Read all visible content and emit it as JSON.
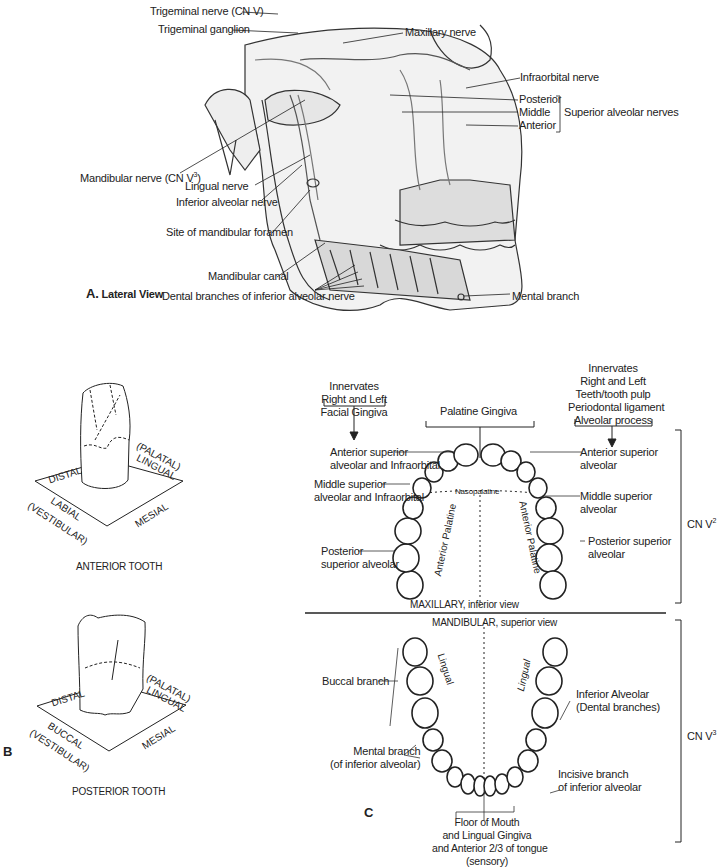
{
  "panel_a": {
    "title_letter": "A.",
    "title": "Lateral View",
    "labels": {
      "trigeminal_nerve": "Trigeminal nerve (CN V)",
      "trigeminal_ganglion": "Trigeminal ganglion",
      "maxillary_nerve": "Maxillary nerve",
      "infraorbital_nerve": "Infraorbital nerve",
      "posterior": "Posterior",
      "middle": "Middle",
      "anterior": "Anterior",
      "superior_alveolar_nerves": "Superior alveolar nerves",
      "mandibular_nerve": "Mandibular nerve (CN V",
      "mandibular_nerve_sup": "3",
      "mandibular_nerve_close": ")",
      "lingual_nerve": "Lingual nerve",
      "inferior_alveolar_nerve": "Inferior alveolar nerve",
      "site_mandibular_foramen": "Site of mandibular foramen",
      "mandibular_canal": "Mandibular canal",
      "mental_branch": "Mental branch",
      "dental_branches": "Dental branches of inferior alveolar nerve"
    }
  },
  "panel_b": {
    "letter": "B",
    "anterior_tooth": {
      "caption": "ANTERIOR TOOTH",
      "distal": "DISTAL",
      "lingual_1": "(PALATAL)",
      "lingual_2": "LINGUAL",
      "labial_1": "LABIAL",
      "labial_2": "(VESTIBULAR)",
      "mesial": "MESIAL"
    },
    "posterior_tooth": {
      "caption": "POSTERIOR TOOTH",
      "distal": "DISTAL",
      "lingual_1": "(PALATAL)",
      "lingual_2": "LINGUAL",
      "buccal_1": "BUCCAL",
      "buccal_2": "(VESTIBULAR)",
      "mesial": "MESIAL"
    }
  },
  "panel_c": {
    "letter": "C",
    "innervates_left": [
      "Innervates",
      "Right and Left",
      "Facial Gingiva"
    ],
    "palatine_gingiva": "Palatine Gingiva",
    "innervates_right": [
      "Innervates",
      "Right and Left",
      "Teeth/tooth pulp",
      "Periodontal ligament",
      "Alveolar process"
    ],
    "maxillary_left": {
      "asa": [
        "Anterior superior",
        "alveolar and Infraorbital"
      ],
      "msa": [
        "Middle superior",
        "alveolar and Infraorbital"
      ],
      "psa": [
        "Posterior",
        "superior alveolar"
      ]
    },
    "maxillary_right": {
      "asa": [
        "Anterior superior",
        "alveolar"
      ],
      "msa": [
        "Middle superior",
        "alveolar"
      ],
      "psa": [
        "Posterior superior",
        "alveolar"
      ]
    },
    "nasopalatine": "Nasopalatine",
    "anterior_palatine": "Anterior Palatine",
    "maxillary_caption": "MAXILLARY, inferior view",
    "mandibular_caption": "MANDIBULAR, superior view",
    "cn_v2": "CN V",
    "cn_v2_sup": "2",
    "cn_v3": "CN V",
    "cn_v3_sup": "3",
    "lingual": "Lingual",
    "buccal_branch": "Buccal branch",
    "mental_branch": [
      "Mental branch",
      "(of inferior alveolar)"
    ],
    "inferior_alveolar": [
      "Inferior Alveolar",
      "(Dental branches)"
    ],
    "incisive_branch": [
      "Incisive branch",
      "of inferior alveolar"
    ],
    "floor_of_mouth": [
      "Floor of Mouth",
      "and Lingual Gingiva",
      "and Anterior 2/3 of tongue",
      "(sensory)"
    ]
  }
}
